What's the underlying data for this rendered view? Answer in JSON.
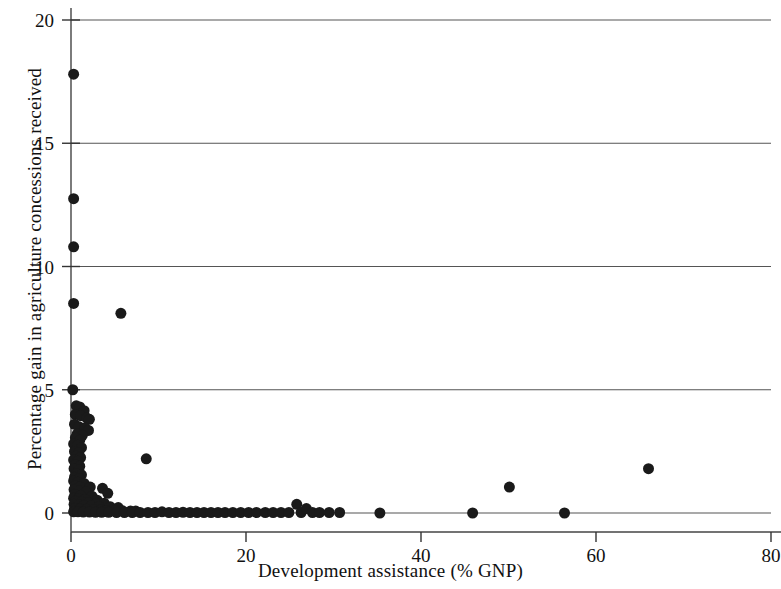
{
  "chart_data": {
    "type": "scatter",
    "title": "",
    "xlabel": "Development assistance (% GNP)",
    "ylabel": "Percentage gain in agriculture concessions received",
    "xlim": [
      0,
      80
    ],
    "ylim": [
      0,
      20
    ],
    "xticks": [
      0,
      20,
      40,
      60,
      80
    ],
    "yticks": [
      0,
      5,
      10,
      15,
      20
    ],
    "xtick_labels": [
      "0",
      "20",
      "40",
      "60",
      "80"
    ],
    "ytick_labels": [
      "0",
      "5",
      "10",
      "15",
      "20"
    ],
    "grid": "horizontal",
    "legend": "none",
    "marker": {
      "shape": "circle",
      "color": "#1a1a1a",
      "size_px": 11
    },
    "series": [
      {
        "name": "countries",
        "points": [
          [
            0.3,
            17.8
          ],
          [
            0.3,
            12.75
          ],
          [
            0.3,
            10.8
          ],
          [
            0.3,
            8.5
          ],
          [
            5.7,
            8.1
          ],
          [
            0.2,
            5.0
          ],
          [
            0.6,
            4.35
          ],
          [
            1.0,
            4.3
          ],
          [
            1.5,
            4.15
          ],
          [
            0.5,
            4.0
          ],
          [
            1.1,
            3.95
          ],
          [
            1.8,
            3.85
          ],
          [
            2.1,
            3.8
          ],
          [
            0.4,
            3.6
          ],
          [
            0.9,
            3.5
          ],
          [
            1.6,
            3.45
          ],
          [
            2.0,
            3.35
          ],
          [
            0.7,
            3.2
          ],
          [
            1.3,
            3.15
          ],
          [
            0.5,
            3.05
          ],
          [
            1.0,
            2.95
          ],
          [
            0.3,
            2.8
          ],
          [
            0.8,
            2.75
          ],
          [
            1.2,
            2.65
          ],
          [
            0.4,
            2.5
          ],
          [
            0.9,
            2.45
          ],
          [
            0.6,
            2.3
          ],
          [
            1.1,
            2.25
          ],
          [
            0.3,
            2.15
          ],
          [
            0.8,
            2.1
          ],
          [
            0.5,
            1.95
          ],
          [
            1.0,
            1.9
          ],
          [
            0.35,
            1.8
          ],
          [
            0.9,
            1.75
          ],
          [
            0.6,
            1.6
          ],
          [
            1.2,
            1.55
          ],
          [
            0.4,
            1.45
          ],
          [
            0.95,
            1.4
          ],
          [
            0.3,
            1.3
          ],
          [
            0.8,
            1.25
          ],
          [
            1.5,
            1.2
          ],
          [
            0.5,
            1.1
          ],
          [
            1.0,
            1.05
          ],
          [
            2.2,
            1.05
          ],
          [
            3.6,
            1.0
          ],
          [
            0.35,
            0.95
          ],
          [
            0.9,
            0.9
          ],
          [
            1.7,
            0.85
          ],
          [
            4.2,
            0.8
          ],
          [
            0.45,
            0.75
          ],
          [
            1.1,
            0.7
          ],
          [
            2.4,
            0.68
          ],
          [
            0.3,
            0.6
          ],
          [
            0.85,
            0.58
          ],
          [
            1.6,
            0.55
          ],
          [
            3.0,
            0.52
          ],
          [
            0.5,
            0.48
          ],
          [
            1.2,
            0.45
          ],
          [
            2.0,
            0.42
          ],
          [
            2.9,
            0.4
          ],
          [
            3.8,
            0.4
          ],
          [
            0.35,
            0.35
          ],
          [
            0.9,
            0.33
          ],
          [
            1.5,
            0.3
          ],
          [
            2.3,
            0.28
          ],
          [
            3.2,
            0.26
          ],
          [
            4.5,
            0.25
          ],
          [
            5.4,
            0.22
          ],
          [
            0.4,
            0.18
          ],
          [
            1.0,
            0.16
          ],
          [
            1.8,
            0.15
          ],
          [
            2.6,
            0.14
          ],
          [
            3.4,
            0.12
          ],
          [
            4.1,
            0.1
          ],
          [
            5.0,
            0.1
          ],
          [
            5.9,
            0.09
          ],
          [
            6.8,
            0.08
          ],
          [
            7.4,
            0.08
          ],
          [
            8.6,
            2.2
          ],
          [
            0.3,
            0.05
          ],
          [
            0.8,
            0.05
          ],
          [
            1.4,
            0.04
          ],
          [
            2.1,
            0.04
          ],
          [
            2.8,
            0.03
          ],
          [
            3.5,
            0.03
          ],
          [
            4.3,
            0.03
          ],
          [
            5.2,
            0.02
          ],
          [
            6.1,
            0.02
          ],
          [
            7.0,
            0.02
          ],
          [
            7.9,
            0.02
          ],
          [
            8.8,
            0.02
          ],
          [
            9.6,
            0.02
          ],
          [
            10.4,
            0.05
          ],
          [
            11.2,
            0.02
          ],
          [
            12.0,
            0.02
          ],
          [
            12.8,
            0.03
          ],
          [
            13.6,
            0.02
          ],
          [
            14.4,
            0.02
          ],
          [
            15.2,
            0.02
          ],
          [
            16.0,
            0.02
          ],
          [
            16.8,
            0.02
          ],
          [
            17.6,
            0.02
          ],
          [
            18.5,
            0.02
          ],
          [
            19.4,
            0.02
          ],
          [
            20.3,
            0.02
          ],
          [
            21.2,
            0.02
          ],
          [
            22.2,
            0.02
          ],
          [
            23.1,
            0.02
          ],
          [
            24.0,
            0.02
          ],
          [
            24.9,
            0.02
          ],
          [
            25.8,
            0.35
          ],
          [
            26.3,
            0.02
          ],
          [
            26.9,
            0.18
          ],
          [
            27.6,
            0.02
          ],
          [
            28.4,
            0.02
          ],
          [
            29.5,
            0.02
          ],
          [
            30.7,
            0.02
          ],
          [
            35.3,
            0.0
          ],
          [
            45.9,
            0.0
          ],
          [
            50.1,
            1.05
          ],
          [
            56.4,
            0.0
          ],
          [
            66.0,
            1.8
          ]
        ]
      }
    ]
  },
  "axes": {
    "left_frame": true,
    "bottom_frame": true
  }
}
